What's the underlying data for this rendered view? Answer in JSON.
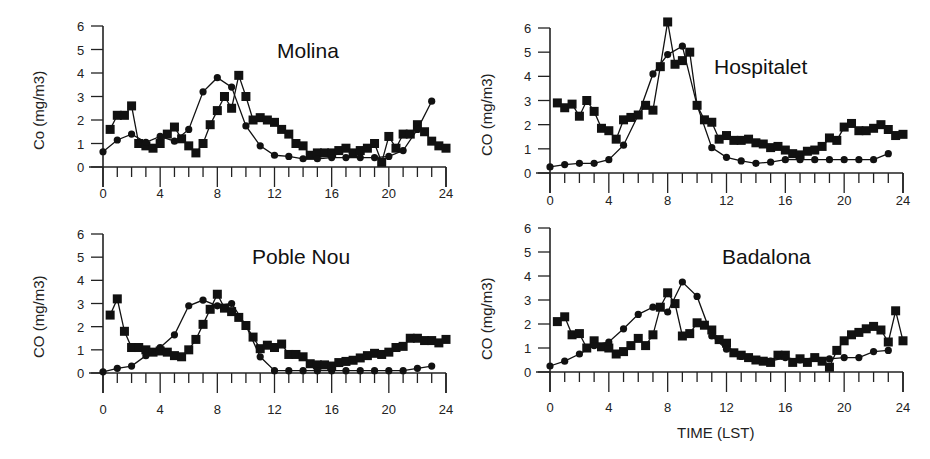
{
  "figure": {
    "xlabel": "TIME (LST)",
    "colors": {
      "axis": "#222222",
      "series": "#111111",
      "background": "#ffffff"
    }
  },
  "chart_data": [
    {
      "type": "line",
      "title": "Molina",
      "xlabel": "",
      "ylabel": "Co (mg/m3)",
      "xlim": [
        0,
        24
      ],
      "ylim": [
        0,
        6
      ],
      "xticks": [
        0,
        4,
        8,
        12,
        16,
        20,
        24
      ],
      "yticks": [
        0,
        1,
        2,
        3,
        4,
        5,
        6
      ],
      "grid": false,
      "series": [
        {
          "name": "squares",
          "marker": "square",
          "x": [
            0.5,
            1,
            1.5,
            2,
            2.5,
            3,
            3.5,
            4,
            4.5,
            5,
            5.5,
            6,
            6.5,
            7,
            7.5,
            8,
            8.5,
            9,
            9.5,
            10,
            10.5,
            11,
            11.5,
            12,
            12.5,
            13,
            13.5,
            14,
            14.5,
            15,
            15.5,
            16,
            16.5,
            17,
            17.5,
            18,
            18.5,
            19,
            19.5,
            20,
            20.5,
            21,
            21.5,
            22,
            22.5,
            23,
            23.5,
            24
          ],
          "values": [
            1.6,
            2.2,
            2.2,
            2.6,
            1.0,
            0.9,
            0.8,
            1.0,
            1.4,
            1.7,
            1.2,
            0.9,
            0.6,
            1.0,
            1.8,
            2.4,
            3.0,
            2.5,
            3.9,
            3.0,
            2.0,
            2.1,
            2.0,
            1.9,
            1.6,
            1.4,
            1.0,
            0.9,
            0.5,
            0.6,
            0.6,
            0.6,
            0.7,
            0.8,
            0.6,
            0.7,
            0.8,
            1.0,
            0.2,
            1.3,
            0.8,
            1.4,
            1.4,
            1.8,
            1.5,
            1.1,
            0.9,
            0.8
          ]
        },
        {
          "name": "circles",
          "marker": "circle",
          "x": [
            0,
            1,
            2,
            3,
            4,
            5,
            6,
            7,
            8,
            9,
            10,
            11,
            12,
            13,
            14,
            15,
            16,
            17,
            18,
            19,
            20,
            21,
            22,
            23
          ],
          "values": [
            0.65,
            1.15,
            1.4,
            1.05,
            1.3,
            1.1,
            1.6,
            3.2,
            3.8,
            3.4,
            1.75,
            0.9,
            0.5,
            0.45,
            0.35,
            0.35,
            0.4,
            0.4,
            0.4,
            0.4,
            0.45,
            0.7,
            1.6,
            2.8
          ]
        }
      ]
    },
    {
      "type": "line",
      "title": "Hospitalet",
      "xlabel": "",
      "ylabel": "CO (mg/m3)",
      "xlim": [
        0,
        24
      ],
      "ylim": [
        0,
        6
      ],
      "xticks": [
        0,
        4,
        8,
        12,
        16,
        20,
        24
      ],
      "yticks": [
        0,
        1,
        2,
        3,
        4,
        5,
        6
      ],
      "grid": false,
      "series": [
        {
          "name": "squares",
          "marker": "square",
          "x": [
            0.5,
            1,
            1.5,
            2,
            2.5,
            3,
            3.5,
            4,
            4.5,
            5,
            5.5,
            6,
            6.5,
            7,
            7.5,
            8,
            8.5,
            9,
            9.5,
            10,
            10.5,
            11,
            11.5,
            12,
            12.5,
            13,
            13.5,
            14,
            14.5,
            15,
            15.5,
            16,
            16.5,
            17,
            17.5,
            18,
            18.5,
            19,
            19.5,
            20,
            20.5,
            21,
            21.5,
            22,
            22.5,
            23,
            23.5,
            24
          ],
          "values": [
            2.9,
            2.7,
            2.85,
            2.35,
            3.0,
            2.55,
            1.85,
            1.75,
            1.4,
            2.2,
            2.3,
            2.4,
            2.8,
            2.6,
            4.4,
            6.25,
            4.5,
            4.65,
            5.0,
            2.8,
            2.2,
            2.1,
            1.4,
            1.55,
            1.35,
            1.35,
            1.4,
            1.25,
            1.2,
            1.05,
            1.1,
            0.95,
            0.8,
            0.75,
            0.9,
            0.95,
            1.1,
            1.45,
            1.35,
            1.9,
            2.05,
            1.75,
            1.75,
            1.85,
            2.0,
            1.8,
            1.55,
            1.6
          ]
        },
        {
          "name": "circles",
          "marker": "circle",
          "x": [
            0,
            1,
            2,
            3,
            4,
            5,
            6,
            7,
            8,
            9,
            10,
            11,
            12,
            13,
            14,
            15,
            16,
            17,
            18,
            19,
            20,
            21,
            22,
            23
          ],
          "values": [
            0.25,
            0.35,
            0.4,
            0.4,
            0.55,
            1.15,
            2.4,
            4.1,
            4.9,
            5.25,
            2.8,
            1.05,
            0.65,
            0.5,
            0.4,
            0.45,
            0.55,
            0.55,
            0.55,
            0.55,
            0.55,
            0.55,
            0.55,
            0.8
          ]
        }
      ]
    },
    {
      "type": "line",
      "title": "Poble Nou",
      "xlabel": "",
      "ylabel": "CO (mg/m3)",
      "xlim": [
        0,
        24
      ],
      "ylim": [
        0,
        6
      ],
      "xticks": [
        0,
        4,
        8,
        12,
        16,
        20,
        24
      ],
      "yticks": [
        0,
        1,
        2,
        3,
        4,
        5,
        6
      ],
      "grid": false,
      "series": [
        {
          "name": "squares",
          "marker": "square",
          "x": [
            0.5,
            1,
            1.5,
            2,
            2.5,
            3,
            3.5,
            4,
            4.5,
            5,
            5.5,
            6,
            6.5,
            7,
            7.5,
            8,
            8.5,
            9,
            9.5,
            10,
            10.5,
            11,
            11.5,
            12,
            12.5,
            13,
            13.5,
            14,
            14.5,
            15,
            15.5,
            16,
            16.5,
            17,
            17.5,
            18,
            18.5,
            19,
            19.5,
            20,
            20.5,
            21,
            21.5,
            22,
            22.5,
            23,
            23.5,
            24
          ],
          "values": [
            2.5,
            3.2,
            1.8,
            1.1,
            1.1,
            1.0,
            0.9,
            0.95,
            0.9,
            0.75,
            0.7,
            1.0,
            1.45,
            2.1,
            2.75,
            3.4,
            2.8,
            2.65,
            2.4,
            2.05,
            1.55,
            1.05,
            1.2,
            1.1,
            1.25,
            0.8,
            0.8,
            0.7,
            0.4,
            0.35,
            0.35,
            0.3,
            0.45,
            0.5,
            0.55,
            0.65,
            0.75,
            0.85,
            0.8,
            0.9,
            1.1,
            1.15,
            1.5,
            1.5,
            1.4,
            1.4,
            1.3,
            1.45,
            1.1
          ]
        },
        {
          "name": "circles",
          "marker": "circle",
          "x": [
            0,
            1,
            2,
            3,
            4,
            5,
            6,
            7,
            8,
            9,
            10,
            11,
            12,
            13,
            14,
            15,
            16,
            17,
            18,
            19,
            20,
            21,
            22,
            23
          ],
          "values": [
            0.05,
            0.2,
            0.3,
            0.75,
            1.1,
            1.65,
            2.9,
            3.15,
            2.9,
            3.0,
            2.05,
            0.7,
            0.1,
            0.1,
            0.1,
            0.1,
            0.1,
            0.1,
            0.1,
            0.1,
            0.1,
            0.1,
            0.2,
            0.3
          ]
        }
      ]
    },
    {
      "type": "line",
      "title": "Badalona",
      "xlabel": "TIME (LST)",
      "ylabel": "CO (mg/m3)",
      "xlim": [
        0,
        24
      ],
      "ylim": [
        0,
        6
      ],
      "xticks": [
        0,
        4,
        8,
        12,
        16,
        20,
        24
      ],
      "yticks": [
        0,
        1,
        2,
        3,
        4,
        5,
        6
      ],
      "grid": false,
      "series": [
        {
          "name": "squares",
          "marker": "square",
          "x": [
            0.5,
            1,
            1.5,
            2,
            2.5,
            3,
            3.5,
            4,
            4.5,
            5,
            5.5,
            6,
            6.5,
            7,
            7.5,
            8,
            8.5,
            9,
            9.5,
            10,
            10.5,
            11,
            11.5,
            12,
            12.5,
            13,
            13.5,
            14,
            14.5,
            15,
            15.5,
            16,
            16.5,
            17,
            17.5,
            18,
            18.5,
            19,
            19.5,
            20,
            20.5,
            21,
            21.5,
            22,
            22.5,
            23,
            23.5,
            24
          ],
          "values": [
            2.1,
            2.3,
            1.55,
            1.6,
            1.0,
            1.3,
            1.05,
            1.0,
            0.75,
            0.85,
            1.1,
            1.4,
            1.1,
            1.55,
            2.7,
            3.3,
            2.85,
            1.5,
            1.6,
            2.05,
            1.95,
            1.75,
            1.35,
            1.2,
            0.8,
            0.7,
            0.6,
            0.5,
            0.45,
            0.4,
            0.7,
            0.7,
            0.4,
            0.55,
            0.4,
            0.6,
            0.45,
            0.2,
            0.9,
            1.3,
            1.55,
            1.65,
            1.8,
            1.9,
            1.75,
            1.25,
            2.55,
            1.3
          ]
        },
        {
          "name": "circles",
          "marker": "circle",
          "x": [
            0,
            1,
            2,
            3,
            4,
            5,
            6,
            7,
            8,
            9,
            10,
            11,
            12,
            13,
            14,
            15,
            16,
            17,
            18,
            19,
            20,
            21,
            22,
            23
          ],
          "values": [
            0.25,
            0.45,
            0.75,
            1.1,
            1.25,
            1.8,
            2.4,
            2.7,
            2.5,
            3.75,
            3.15,
            1.5,
            0.95,
            0.65,
            0.5,
            0.45,
            0.6,
            0.5,
            0.6,
            0.55,
            0.6,
            0.6,
            0.85,
            0.9
          ]
        }
      ]
    }
  ]
}
